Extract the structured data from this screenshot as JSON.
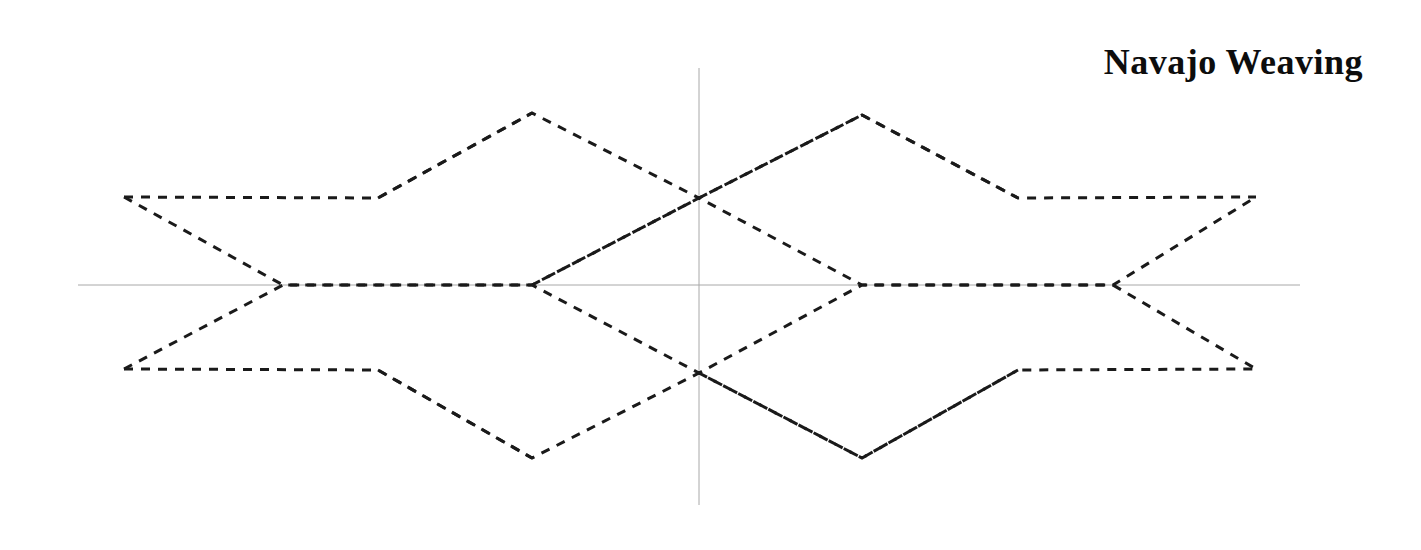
{
  "page": {
    "width": 1421,
    "height": 550,
    "background": "#ffffff"
  },
  "title": {
    "text": "Navajo Weaving",
    "color": "#0d0d0d"
  },
  "axes": {
    "color": "#a8a8a8",
    "stroke_width": 1,
    "origin": [
      699,
      285
    ],
    "x_axis": {
      "x1": 78,
      "y1": 285,
      "x2": 1300,
      "y2": 285
    },
    "y_axis": {
      "x1": 699,
      "y1": 68,
      "x2": 699,
      "y2": 505
    }
  },
  "chart_data": {
    "type": "line",
    "title": "Navajo Weaving",
    "xlabel": "",
    "ylabel": "",
    "grid": false,
    "legend": "none",
    "style": {
      "line_color": "#1a1a1a",
      "line_width": 3,
      "dash_pattern": "9 8",
      "line_cap": "butt"
    },
    "xlim": [
      78,
      1300
    ],
    "ylim": [
      68,
      505
    ],
    "key_points": {
      "left_tip_upper": [
        124,
        197
      ],
      "left_tip_lower": [
        124,
        369
      ],
      "left_node": [
        283,
        285
      ],
      "left_vertex_upper": [
        378,
        198
      ],
      "left_vertex_lower": [
        378,
        370
      ],
      "diamond1_top": [
        532,
        113
      ],
      "diamond1_bottom": [
        532,
        458
      ],
      "diamond1_center": [
        532,
        285
      ],
      "axis_cross_upper": [
        699,
        198
      ],
      "axis_cross_lower": [
        699,
        373
      ],
      "diamond2_top": [
        862,
        115
      ],
      "diamond2_bottom": [
        862,
        458
      ],
      "diamond2_center": [
        862,
        285
      ],
      "right_vertex_upper": [
        1018,
        198
      ],
      "right_vertex_lower": [
        1018,
        370
      ],
      "right_node": [
        1113,
        285
      ],
      "right_tip_upper": [
        1256,
        197
      ],
      "right_tip_lower": [
        1256,
        369
      ]
    },
    "series": [
      {
        "name": "upper-left-hexagon-band",
        "points": [
          [
            124,
            197
          ],
          [
            378,
            198
          ],
          [
            532,
            113
          ],
          [
            699,
            198
          ],
          [
            862,
            115
          ],
          [
            1018,
            198
          ],
          [
            1256,
            197
          ]
        ]
      },
      {
        "name": "lower-left-hexagon-band",
        "points": [
          [
            124,
            369
          ],
          [
            378,
            370
          ],
          [
            532,
            458
          ],
          [
            699,
            373
          ],
          [
            862,
            458
          ],
          [
            1018,
            370
          ],
          [
            1256,
            369
          ]
        ]
      },
      {
        "name": "upper-inner-zigzag",
        "points": [
          [
            124,
            197
          ],
          [
            283,
            285
          ],
          [
            532,
            285
          ],
          [
            699,
            198
          ],
          [
            862,
            285
          ],
          [
            1113,
            285
          ],
          [
            1256,
            197
          ]
        ]
      },
      {
        "name": "lower-inner-zigzag",
        "points": [
          [
            124,
            369
          ],
          [
            283,
            285
          ],
          [
            532,
            285
          ],
          [
            699,
            373
          ],
          [
            862,
            285
          ],
          [
            1113,
            285
          ],
          [
            1256,
            369
          ]
        ]
      },
      {
        "name": "diamond1-left-upper-edge",
        "points": [
          [
            378,
            198
          ],
          [
            532,
            113
          ]
        ]
      },
      {
        "name": "diamond1-right-lower-edge",
        "points": [
          [
            532,
            285
          ],
          [
            699,
            198
          ]
        ]
      },
      {
        "name": "diamond1-lower-left-edge",
        "points": [
          [
            378,
            370
          ],
          [
            532,
            458
          ]
        ]
      },
      {
        "name": "diamond2-left-upper-edge",
        "points": [
          [
            699,
            198
          ],
          [
            862,
            115
          ]
        ]
      },
      {
        "name": "diamond2-right-upper-edge",
        "points": [
          [
            862,
            115
          ],
          [
            1018,
            198
          ]
        ]
      },
      {
        "name": "diamond2-lower-edges",
        "points": [
          [
            699,
            373
          ],
          [
            862,
            458
          ],
          [
            1018,
            370
          ]
        ]
      }
    ]
  }
}
